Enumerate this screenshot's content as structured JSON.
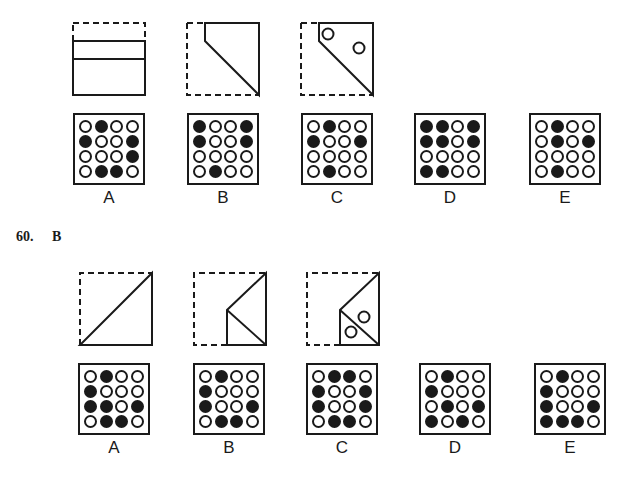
{
  "problem_59": {
    "fold_steps": [
      {
        "step": 1,
        "description": "top strip folded down"
      },
      {
        "step": 2,
        "description": "left side folded diagonally"
      },
      {
        "step": 3,
        "description": "two holes punched"
      }
    ],
    "options": [
      {
        "label": "A",
        "grid": [
          [
            0,
            1,
            0,
            0
          ],
          [
            1,
            0,
            0,
            1
          ],
          [
            0,
            0,
            0,
            1
          ],
          [
            0,
            1,
            1,
            0
          ]
        ]
      },
      {
        "label": "B",
        "grid": [
          [
            1,
            0,
            0,
            1
          ],
          [
            1,
            0,
            0,
            1
          ],
          [
            0,
            0,
            0,
            0
          ],
          [
            0,
            1,
            0,
            0
          ]
        ]
      },
      {
        "label": "C",
        "grid": [
          [
            0,
            1,
            0,
            0
          ],
          [
            1,
            0,
            0,
            1
          ],
          [
            0,
            0,
            0,
            0
          ],
          [
            0,
            1,
            0,
            0
          ]
        ]
      },
      {
        "label": "D",
        "grid": [
          [
            1,
            1,
            0,
            1
          ],
          [
            1,
            1,
            0,
            1
          ],
          [
            0,
            0,
            0,
            0
          ],
          [
            1,
            1,
            0,
            0
          ]
        ]
      },
      {
        "label": "E",
        "grid": [
          [
            0,
            1,
            0,
            0
          ],
          [
            0,
            1,
            0,
            1
          ],
          [
            0,
            0,
            0,
            0
          ],
          [
            0,
            1,
            0,
            0
          ]
        ]
      }
    ]
  },
  "problem_60": {
    "number": "60.",
    "answer": "B",
    "fold_steps": [
      {
        "step": 1,
        "description": "folded along diagonal"
      },
      {
        "step": 2,
        "description": "folded again vertically"
      },
      {
        "step": 3,
        "description": "two holes punched"
      }
    ],
    "options": [
      {
        "label": "A",
        "grid": [
          [
            0,
            1,
            0,
            0
          ],
          [
            1,
            0,
            0,
            0
          ],
          [
            1,
            1,
            0,
            1
          ],
          [
            0,
            1,
            1,
            0
          ]
        ]
      },
      {
        "label": "B",
        "grid": [
          [
            0,
            1,
            0,
            0
          ],
          [
            1,
            0,
            0,
            0
          ],
          [
            1,
            0,
            0,
            1
          ],
          [
            0,
            1,
            1,
            0
          ]
        ]
      },
      {
        "label": "C",
        "grid": [
          [
            0,
            1,
            1,
            0
          ],
          [
            1,
            0,
            0,
            1
          ],
          [
            1,
            0,
            0,
            1
          ],
          [
            0,
            1,
            1,
            0
          ]
        ]
      },
      {
        "label": "D",
        "grid": [
          [
            0,
            1,
            0,
            0
          ],
          [
            1,
            0,
            0,
            0
          ],
          [
            0,
            1,
            0,
            1
          ],
          [
            1,
            0,
            1,
            0
          ]
        ]
      },
      {
        "label": "E",
        "grid": [
          [
            0,
            1,
            0,
            0
          ],
          [
            1,
            0,
            0,
            0
          ],
          [
            1,
            0,
            0,
            1
          ],
          [
            1,
            1,
            1,
            0
          ]
        ]
      }
    ]
  }
}
